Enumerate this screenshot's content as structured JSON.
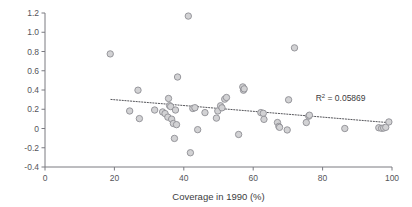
{
  "chart_data": {
    "type": "scatter",
    "title": "",
    "xlabel": "Coverage in 1990 (%)",
    "ylabel": "",
    "xlim": [
      0,
      100
    ],
    "ylim": [
      -0.4,
      1.2
    ],
    "xticks": [
      0,
      20,
      40,
      60,
      80,
      100
    ],
    "xtick_labels": [
      "0",
      "20",
      "40",
      "60",
      "80",
      "100"
    ],
    "yticks": [
      -0.4,
      -0.2,
      0,
      0.2,
      0.4,
      0.6,
      0.8,
      1.0,
      1.2
    ],
    "ytick_labels": [
      "-0.4",
      "-0.2",
      "0",
      "0.2",
      "0.4",
      "0.6",
      "0.8",
      "1.0",
      "1.2"
    ],
    "grid": false,
    "legend": null,
    "annotations": [
      {
        "name": "r-squared",
        "text": "R2 = 0.05869",
        "display_prefix": "R",
        "display_sup": "2",
        "display_suffix": " = 0.05869",
        "value": 0.05869,
        "x": 78,
        "y": 0.285
      }
    ],
    "trendline": {
      "style": "dotted",
      "x": [
        19.0,
        100.0
      ],
      "y": [
        0.302,
        0.058
      ]
    },
    "marker": {
      "shape": "circle",
      "fill": "#d2d2d4",
      "edge": "#8e8e94",
      "size_px": 6.4
    },
    "points": [
      {
        "x": 18.8,
        "y": 0.775
      },
      {
        "x": 24.4,
        "y": 0.182
      },
      {
        "x": 26.8,
        "y": 0.398
      },
      {
        "x": 27.2,
        "y": 0.103
      },
      {
        "x": 31.6,
        "y": 0.192
      },
      {
        "x": 33.9,
        "y": 0.172
      },
      {
        "x": 34.6,
        "y": 0.155
      },
      {
        "x": 35.4,
        "y": 0.118
      },
      {
        "x": 35.6,
        "y": 0.312
      },
      {
        "x": 35.9,
        "y": 0.238
      },
      {
        "x": 36.2,
        "y": 0.228
      },
      {
        "x": 36.5,
        "y": 0.097
      },
      {
        "x": 37.0,
        "y": 0.052
      },
      {
        "x": 37.3,
        "y": -0.103
      },
      {
        "x": 37.6,
        "y": 0.192
      },
      {
        "x": 37.9,
        "y": 0.04
      },
      {
        "x": 38.2,
        "y": 0.535
      },
      {
        "x": 41.3,
        "y": 1.168
      },
      {
        "x": 41.9,
        "y": -0.252
      },
      {
        "x": 42.6,
        "y": 0.208
      },
      {
        "x": 43.2,
        "y": 0.216
      },
      {
        "x": 44.0,
        "y": -0.012
      },
      {
        "x": 46.1,
        "y": 0.165
      },
      {
        "x": 49.4,
        "y": 0.108
      },
      {
        "x": 49.8,
        "y": 0.182
      },
      {
        "x": 50.6,
        "y": 0.236
      },
      {
        "x": 51.0,
        "y": 0.215
      },
      {
        "x": 51.8,
        "y": 0.305
      },
      {
        "x": 52.3,
        "y": 0.322
      },
      {
        "x": 55.8,
        "y": -0.062
      },
      {
        "x": 57.0,
        "y": 0.432
      },
      {
        "x": 57.2,
        "y": 0.398
      },
      {
        "x": 57.4,
        "y": 0.412
      },
      {
        "x": 62.2,
        "y": 0.165
      },
      {
        "x": 62.9,
        "y": 0.158
      },
      {
        "x": 63.1,
        "y": 0.095
      },
      {
        "x": 67.0,
        "y": 0.062
      },
      {
        "x": 67.4,
        "y": 0.022
      },
      {
        "x": 67.6,
        "y": 0.012
      },
      {
        "x": 69.8,
        "y": -0.015
      },
      {
        "x": 70.2,
        "y": 0.298
      },
      {
        "x": 71.9,
        "y": 0.838
      },
      {
        "x": 75.3,
        "y": 0.062
      },
      {
        "x": 76.0,
        "y": 0.128
      },
      {
        "x": 76.2,
        "y": 0.138
      },
      {
        "x": 86.4,
        "y": 0.0
      },
      {
        "x": 96.2,
        "y": 0.008
      },
      {
        "x": 97.0,
        "y": 0.002
      },
      {
        "x": 97.6,
        "y": 0.005
      },
      {
        "x": 98.2,
        "y": 0.012
      },
      {
        "x": 99.1,
        "y": 0.068
      }
    ]
  }
}
